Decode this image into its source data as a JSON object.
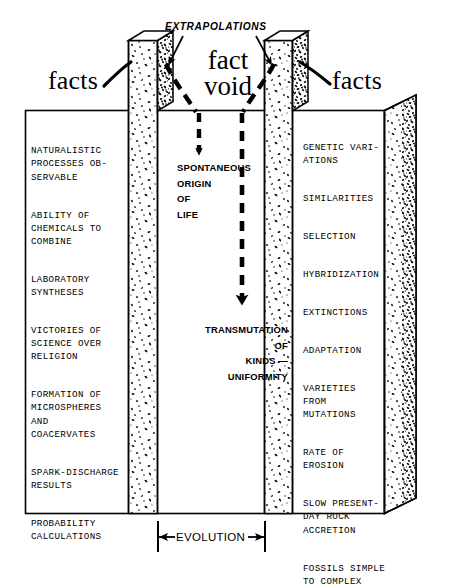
{
  "diagram": {
    "colors": {
      "ink": "#000000",
      "paper": "#ffffff",
      "stipple_light": "#111111",
      "stipple_dark": "#000000"
    },
    "top_labels": {
      "extrapolations": "EXTRAPOLATIONS",
      "facts_left": "facts",
      "facts_right": "facts",
      "void": "fact\nvoid"
    },
    "bottom_label": {
      "evolution": "EVOLUTION",
      "left_arrow": "←",
      "right_arrow": "→"
    },
    "center_column": {
      "upper": "SPONTANEOUS\nORIGIN\nOF\nLIFE",
      "lower": "TRANSMUTATION\nOF\nKINDS —\nUNIFORMITY"
    },
    "left_column": {
      "heading": "facts",
      "items": [
        "NATURALISTIC\nPROCESSES OB-\nSERVABLE",
        "ABILITY OF\nCHEMICALS TO\nCOMBINE",
        "LABORATORY\nSYNTHESES",
        "VICTORIES OF\nSCIENCE OVER\nRELIGION",
        "FORMATION OF\nMICROSPHERES\nAND\nCOACERVATES",
        "SPARK-DISCHARGE\nRESULTS",
        "PROBABILITY\nCALCULATIONS"
      ]
    },
    "right_column": {
      "heading": "facts",
      "items": [
        "GENETIC VARI-\nATIONS",
        "SIMILARITIES",
        "SELECTION",
        "HYBRIDIZATION",
        "EXTINCTIONS",
        "ADAPTATION",
        "VARIETIES\nFROM\nMUTATIONS",
        "RATE OF\nEROSION",
        "SLOW PRESENT-\nDAY ROCK\nACCRETION",
        "FOSSILS SIMPLE\nTO COMPLEX"
      ]
    }
  }
}
